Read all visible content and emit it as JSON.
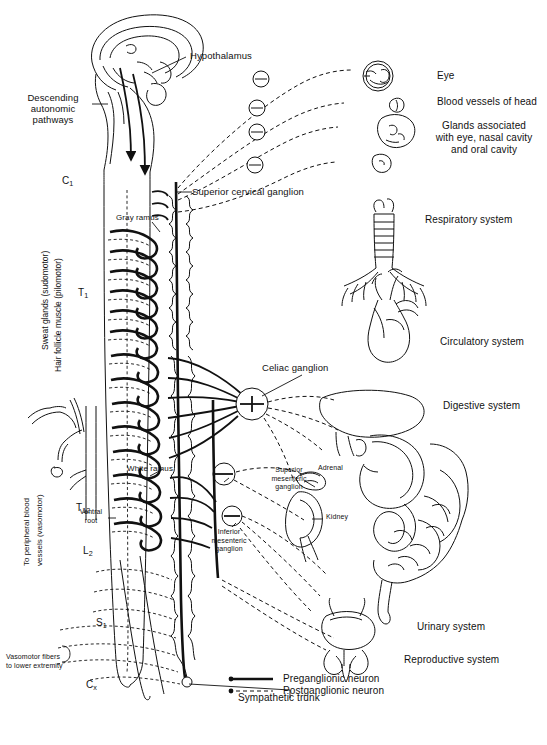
{
  "figure": {
    "caption": ""
  },
  "brain_labels": {
    "hypothalamus": "Hypothalamus",
    "descending_pathways": "Descending\nautonomic\npathways"
  },
  "spinal_levels": [
    {
      "id": "c1",
      "main": "C",
      "sub": "1"
    },
    {
      "id": "t1",
      "main": "T",
      "sub": "1"
    },
    {
      "id": "t12",
      "main": "T",
      "sub": "12"
    },
    {
      "id": "l2",
      "main": "L",
      "sub": "2"
    },
    {
      "id": "s1",
      "main": "S",
      "sub": "1"
    },
    {
      "id": "cx",
      "main": "C",
      "sub": "x"
    }
  ],
  "spine_labels": {
    "gray_ramus": "Gray ramus",
    "white_ramus": "White ramus",
    "ventral_root": "Ventral\nroot",
    "sympathetic_trunk": "Sympathetic trunk"
  },
  "ganglia": {
    "superior_cervical": "Superior cervical ganglion",
    "celiac": "Celiac  ganglion",
    "superior_mesenteric": "Superior\nmesenteric\nganglion",
    "inferior_mesenteric": "Inferior\nmesenteric\nganglion"
  },
  "left_labels": {
    "sweat_glands": "Sweat glands (sudomotor)",
    "hair_follicle": "Hair follicle muscle (pilomotor)",
    "peripheral_vessels": "To peripheral blood\nvessels (vasomotor)",
    "vasomotor_lower": "Vasomotor fibers\nto lower extremity"
  },
  "target_organs": [
    {
      "id": "eye",
      "label": "Eye"
    },
    {
      "id": "head-vessels",
      "label": "Blood vessels of head"
    },
    {
      "id": "glands",
      "label": "Glands associated\nwith eye, nasal cavity\nand oral cavity"
    },
    {
      "id": "respiratory",
      "label": "Respiratory system"
    },
    {
      "id": "circulatory",
      "label": "Circulatory system"
    },
    {
      "id": "digestive",
      "label": "Digestive system"
    },
    {
      "id": "urinary",
      "label": "Urinary system"
    },
    {
      "id": "reproductive",
      "label": "Reproductive system"
    }
  ],
  "organ_annotations": {
    "adrenal": "Adrenal",
    "kidney": "Kidney"
  },
  "legend": {
    "preganglionic": "Preganglionic neuron",
    "postganglionic": "Postganglionic neuron"
  },
  "colors": {
    "ink": "#111111",
    "background": "#ffffff"
  }
}
